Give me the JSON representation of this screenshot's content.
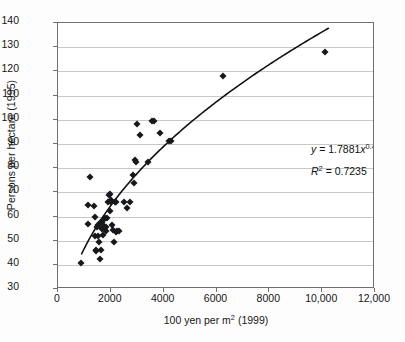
{
  "chart_data": {
    "type": "scatter",
    "title": "",
    "xlabel": "100 yen per m2 (1999)",
    "xlabel_prefix": "100 yen per m",
    "xlabel_sup": "2",
    "xlabel_suffix": " (1999)",
    "ylabel": "Persons per hectare (1995)",
    "xlim": [
      0,
      12000
    ],
    "ylim": [
      30,
      140
    ],
    "xticks": [
      0,
      2000,
      4000,
      6000,
      8000,
      10000,
      12000
    ],
    "xtick_labels": [
      "0",
      "2000",
      "4000",
      "6000",
      "8000",
      "10,000",
      "12,000"
    ],
    "yticks": [
      30,
      40,
      50,
      60,
      70,
      80,
      90,
      100,
      110,
      120,
      130,
      140
    ],
    "ytick_labels": [
      "30",
      "40",
      "50",
      "60",
      "70",
      "80",
      "90",
      "100",
      "110",
      "120",
      "130",
      "140"
    ],
    "grid": "horizontal",
    "legend": "none",
    "marker_shape": "diamond",
    "marker_color": "#16181c",
    "gridline_color": "#c8c8c8",
    "frame_color": "#6f6f6f",
    "trendline_color": "#111111",
    "annotations": [
      {
        "name": "regression-equation",
        "text": "y = 1.7881x0.4702",
        "parts": {
          "lhs": "y",
          "eq": " = ",
          "coef": "1.7881",
          "var": "x",
          "exp": "0.4702"
        }
      },
      {
        "name": "r-squared",
        "text": "R2 = 0.7235",
        "parts": {
          "lhs": "R",
          "exp": "2",
          "eq": " = ",
          "value": "0.7235"
        }
      }
    ],
    "trendline": {
      "form": "power",
      "a": 1.7881,
      "b": 0.4702,
      "x_start": 900,
      "x_end": 10300
    },
    "points": [
      [
        880,
        40.8
      ],
      [
        1200,
        76.5
      ],
      [
        1150,
        64.8
      ],
      [
        1120,
        56.7
      ],
      [
        1350,
        64.2
      ],
      [
        1380,
        59.6
      ],
      [
        1400,
        51.8
      ],
      [
        1420,
        46.3
      ],
      [
        1450,
        45.8
      ],
      [
        1480,
        55.8
      ],
      [
        1500,
        52.0
      ],
      [
        1530,
        56.5
      ],
      [
        1560,
        49.6
      ],
      [
        1580,
        57.2
      ],
      [
        1600,
        42.6
      ],
      [
        1620,
        46.0
      ],
      [
        1650,
        57.8
      ],
      [
        1660,
        54.9
      ],
      [
        1680,
        55.4
      ],
      [
        1700,
        58.4
      ],
      [
        1720,
        52.2
      ],
      [
        1750,
        56.0
      ],
      [
        1780,
        59.2
      ],
      [
        1800,
        55.7
      ],
      [
        1830,
        54.0
      ],
      [
        1860,
        59.4
      ],
      [
        1900,
        66.1
      ],
      [
        1930,
        68.8
      ],
      [
        1960,
        69.2
      ],
      [
        1980,
        62.4
      ],
      [
        2000,
        67.0
      ],
      [
        2020,
        65.9
      ],
      [
        2050,
        56.3
      ],
      [
        2080,
        54.6
      ],
      [
        2100,
        49.6
      ],
      [
        2150,
        66.2
      ],
      [
        2180,
        65.8
      ],
      [
        2200,
        53.4
      ],
      [
        2250,
        54.1
      ],
      [
        2300,
        54.2
      ],
      [
        2480,
        65.8
      ],
      [
        2600,
        63.4
      ],
      [
        2720,
        66.0
      ],
      [
        2820,
        77.3
      ],
      [
        2860,
        74.0
      ],
      [
        2900,
        83.2
      ],
      [
        2950,
        82.6
      ],
      [
        3000,
        98.3
      ],
      [
        3120,
        93.6
      ],
      [
        3400,
        82.7
      ],
      [
        3550,
        99.4
      ],
      [
        3620,
        99.3
      ],
      [
        3850,
        94.6
      ],
      [
        4200,
        91.3
      ],
      [
        4280,
        91.1
      ],
      [
        6250,
        118.1
      ],
      [
        10100,
        128.0
      ]
    ]
  }
}
